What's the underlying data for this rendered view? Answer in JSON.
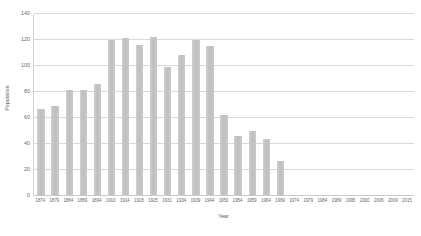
{
  "chart_data": {
    "type": "bar",
    "title": "",
    "xlabel": "Year",
    "ylabel": "Population",
    "ylim": [
      0,
      140
    ],
    "yticks": [
      0,
      20,
      40,
      60,
      80,
      100,
      120,
      140
    ],
    "grid": true,
    "legend": false,
    "bar_color": "#c6c6c6",
    "gridline_color": "#d9d9d9",
    "categories": [
      "1874",
      "1879",
      "1884",
      "1889",
      "1894",
      "1910",
      "1914",
      "1918",
      "1925",
      "1931",
      "1934",
      "1939",
      "1944",
      "1950",
      "1954",
      "1959",
      "1964",
      "1969",
      "1974",
      "1979",
      "1984",
      "1989",
      "1995",
      "2000",
      "2006",
      "2009",
      "2015"
    ],
    "values": [
      67,
      69,
      81,
      81,
      86,
      120,
      121,
      116,
      122,
      99,
      108,
      120,
      115,
      62,
      46,
      50,
      44,
      27,
      0,
      0,
      0,
      0,
      0,
      0,
      0,
      0,
      0
    ]
  }
}
